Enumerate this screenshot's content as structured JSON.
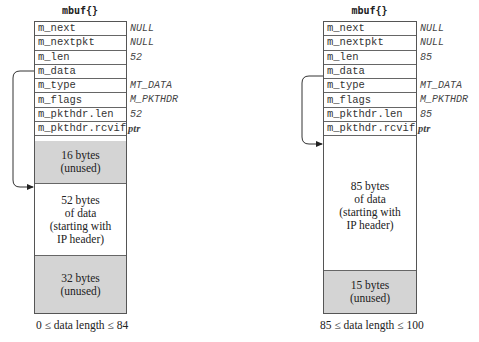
{
  "left": {
    "title": "mbuf{}",
    "fields": [
      {
        "name": "m_next",
        "value": "NULL"
      },
      {
        "name": "m_nextpkt",
        "value": "NULL"
      },
      {
        "name": "m_len",
        "value": "52"
      },
      {
        "name": "m_data",
        "value": ""
      },
      {
        "name": "m_type",
        "value": "MT_DATA"
      },
      {
        "name": "m_flags",
        "value": "M_PKTHDR"
      },
      {
        "name": "m_pkthdr.len",
        "value": "52"
      },
      {
        "name": "m_pkthdr.rcvif",
        "value": "ptr"
      }
    ],
    "blocks": [
      {
        "label": "16 bytes\n(unused)",
        "type": "unused"
      },
      {
        "label": "52 bytes\nof data\n(starting with\nIP header)",
        "type": "data"
      },
      {
        "label": "32 bytes\n(unused)",
        "type": "unused"
      }
    ],
    "caption": "0 ≤ data length ≤ 84"
  },
  "right": {
    "title": "mbuf{}",
    "fields": [
      {
        "name": "m_next",
        "value": "NULL"
      },
      {
        "name": "m_nextpkt",
        "value": "NULL"
      },
      {
        "name": "m_len",
        "value": "85"
      },
      {
        "name": "m_data",
        "value": ""
      },
      {
        "name": "m_type",
        "value": "MT_DATA"
      },
      {
        "name": "m_flags",
        "value": "M_PKTHDR"
      },
      {
        "name": "m_pkthdr.len",
        "value": "85"
      },
      {
        "name": "m_pkthdr.rcvif",
        "value": "ptr"
      }
    ],
    "blocks": [
      {
        "label": "85 bytes\nof data\n(starting with\nIP header)",
        "type": "data"
      },
      {
        "label": "15 bytes\n(unused)",
        "type": "unused"
      }
    ],
    "caption": "85 ≤ data length ≤ 100"
  },
  "colors": {
    "unused_fill": "#d4d4d4",
    "border": "#555555"
  }
}
